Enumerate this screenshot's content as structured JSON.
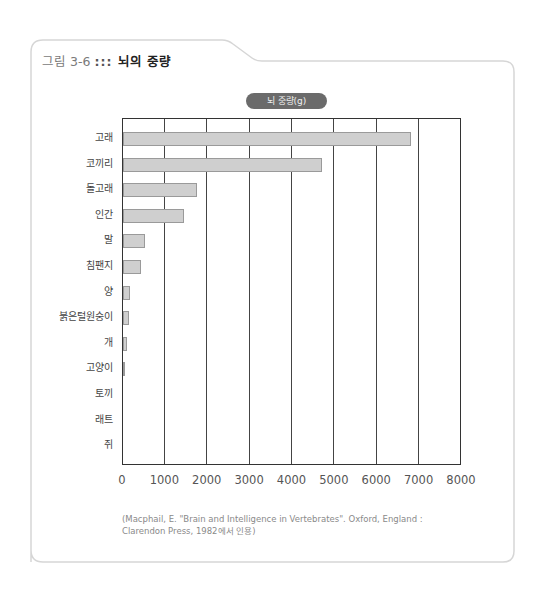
{
  "figure": {
    "number": "그림 3-6",
    "separator": ":::",
    "title": "뇌의 중량"
  },
  "legend": {
    "label": "뇌 중량(g)"
  },
  "source": {
    "line1": "(Macphail, E. \"Brain and Intelligence in Vertebrates\". Oxford, England :",
    "line2": "Clarendon Press, 1982에서 인용)"
  },
  "chart_data": {
    "type": "bar",
    "orientation": "horizontal",
    "title": "뇌의 중량",
    "xlabel": "",
    "ylabel": "",
    "legend": [
      "뇌 중량(g)"
    ],
    "legend_position": "top-center",
    "grid": true,
    "xlim": [
      0,
      8000
    ],
    "xticks": [
      "0",
      "1000",
      "2000",
      "3000",
      "4000",
      "5000",
      "6000",
      "7000",
      "8000"
    ],
    "categories": [
      "고래",
      "코끼리",
      "돌고래",
      "인간",
      "말",
      "침팬지",
      "양",
      "붉은털원숭이",
      "개",
      "고양이",
      "토끼",
      "래트",
      "쥐"
    ],
    "values": [
      6800,
      4700,
      1750,
      1450,
      530,
      430,
      170,
      130,
      90,
      30,
      12,
      2,
      0.4
    ],
    "series": [
      {
        "name": "뇌 중량(g)",
        "values": [
          6800,
          4700,
          1750,
          1450,
          530,
          430,
          170,
          130,
          90,
          30,
          12,
          2,
          0.4
        ]
      }
    ],
    "colors": {
      "bar_fill": "#cfcfcf",
      "bar_border": "#9a9a9a",
      "legend_bg": "#6b6b6b"
    }
  }
}
